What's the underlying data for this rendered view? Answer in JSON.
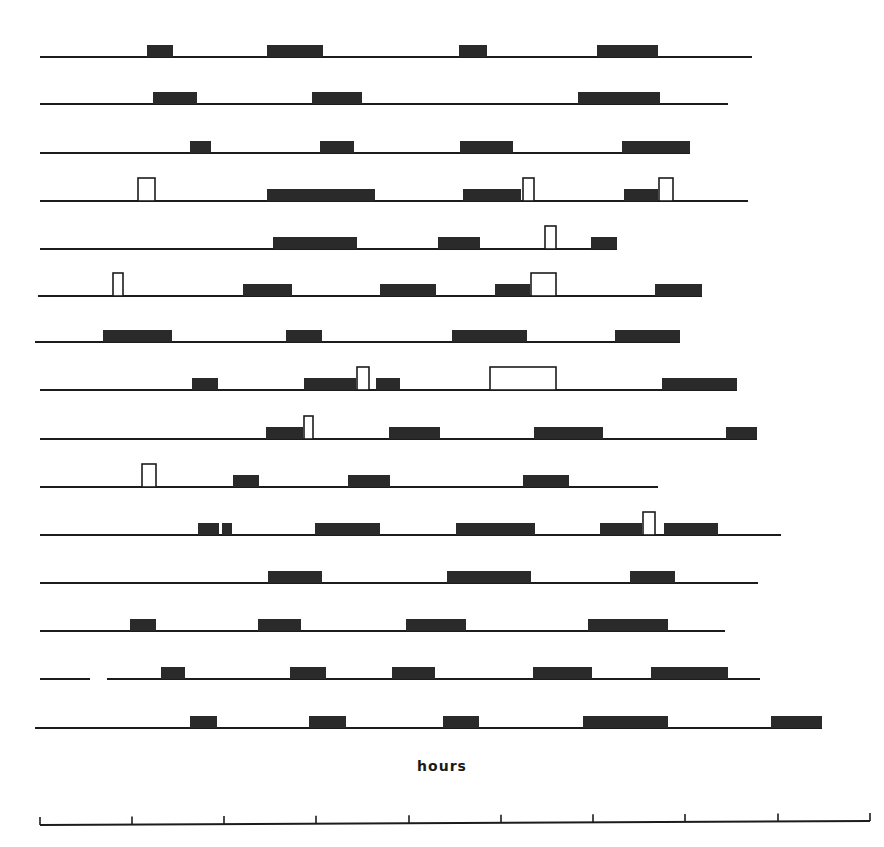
{
  "chart_data": {
    "type": "gantt-raster",
    "title": "",
    "xlabel": "hours",
    "ylabel": "",
    "axis": {
      "y": 825,
      "x_start": 40,
      "x_end": 870,
      "ticks_px": [
        40,
        132,
        224,
        316,
        409,
        501,
        593,
        685,
        778,
        870
      ],
      "tick_labels": []
    },
    "colors": {
      "ink": "#1c1c1c",
      "filled": "#2a2a2a",
      "open_fill": "#ffffff"
    },
    "bar_height": 12,
    "open_height": 23,
    "rows": [
      {
        "y": 57,
        "line": [
          [
            40,
            752
          ]
        ],
        "blocks": [
          {
            "x0": 147,
            "x1": 173,
            "type": "filled"
          },
          {
            "x0": 267,
            "x1": 323,
            "type": "filled"
          },
          {
            "x0": 459,
            "x1": 487,
            "type": "filled"
          },
          {
            "x0": 597,
            "x1": 658,
            "type": "filled"
          }
        ]
      },
      {
        "y": 104,
        "line": [
          [
            40,
            728
          ]
        ],
        "blocks": [
          {
            "x0": 153,
            "x1": 197,
            "type": "filled"
          },
          {
            "x0": 312,
            "x1": 362,
            "type": "filled"
          },
          {
            "x0": 578,
            "x1": 660,
            "type": "filled"
          }
        ]
      },
      {
        "y": 153,
        "line": [
          [
            40,
            690
          ]
        ],
        "blocks": [
          {
            "x0": 190,
            "x1": 211,
            "type": "filled"
          },
          {
            "x0": 320,
            "x1": 354,
            "type": "filled"
          },
          {
            "x0": 460,
            "x1": 513,
            "type": "filled"
          },
          {
            "x0": 622,
            "x1": 690,
            "type": "filled"
          }
        ]
      },
      {
        "y": 201,
        "line": [
          [
            40,
            748
          ]
        ],
        "blocks": [
          {
            "x0": 137,
            "x1": 156,
            "type": "open"
          },
          {
            "x0": 267,
            "x1": 375,
            "type": "filled"
          },
          {
            "x0": 463,
            "x1": 521,
            "type": "filled"
          },
          {
            "x0": 522,
            "x1": 535,
            "type": "open"
          },
          {
            "x0": 624,
            "x1": 658,
            "type": "filled"
          },
          {
            "x0": 658,
            "x1": 674,
            "type": "open"
          }
        ]
      },
      {
        "y": 249,
        "line": [
          [
            40,
            617
          ]
        ],
        "blocks": [
          {
            "x0": 273,
            "x1": 357,
            "type": "filled"
          },
          {
            "x0": 438,
            "x1": 480,
            "type": "filled"
          },
          {
            "x0": 544,
            "x1": 557,
            "type": "open"
          },
          {
            "x0": 591,
            "x1": 617,
            "type": "filled"
          }
        ]
      },
      {
        "y": 296,
        "line": [
          [
            38,
            702
          ]
        ],
        "blocks": [
          {
            "x0": 112,
            "x1": 124,
            "type": "open"
          },
          {
            "x0": 243,
            "x1": 292,
            "type": "filled"
          },
          {
            "x0": 380,
            "x1": 436,
            "type": "filled"
          },
          {
            "x0": 495,
            "x1": 530,
            "type": "filled"
          },
          {
            "x0": 530,
            "x1": 557,
            "type": "open"
          },
          {
            "x0": 655,
            "x1": 702,
            "type": "filled"
          }
        ]
      },
      {
        "y": 342,
        "line": [
          [
            35,
            680
          ]
        ],
        "blocks": [
          {
            "x0": 103,
            "x1": 172,
            "type": "filled"
          },
          {
            "x0": 286,
            "x1": 322,
            "type": "filled"
          },
          {
            "x0": 452,
            "x1": 527,
            "type": "filled"
          },
          {
            "x0": 615,
            "x1": 680,
            "type": "filled"
          }
        ]
      },
      {
        "y": 390,
        "line": [
          [
            40,
            737
          ]
        ],
        "blocks": [
          {
            "x0": 192,
            "x1": 218,
            "type": "filled"
          },
          {
            "x0": 304,
            "x1": 356,
            "type": "filled"
          },
          {
            "x0": 356,
            "x1": 370,
            "type": "open"
          },
          {
            "x0": 376,
            "x1": 400,
            "type": "filled"
          },
          {
            "x0": 489,
            "x1": 557,
            "type": "open"
          },
          {
            "x0": 662,
            "x1": 737,
            "type": "filled"
          }
        ]
      },
      {
        "y": 439,
        "line": [
          [
            40,
            757
          ]
        ],
        "blocks": [
          {
            "x0": 266,
            "x1": 303,
            "type": "filled"
          },
          {
            "x0": 303,
            "x1": 314,
            "type": "open"
          },
          {
            "x0": 389,
            "x1": 440,
            "type": "filled"
          },
          {
            "x0": 534,
            "x1": 603,
            "type": "filled"
          },
          {
            "x0": 726,
            "x1": 757,
            "type": "filled"
          }
        ]
      },
      {
        "y": 487,
        "line": [
          [
            40,
            658
          ]
        ],
        "blocks": [
          {
            "x0": 141,
            "x1": 157,
            "type": "open"
          },
          {
            "x0": 233,
            "x1": 259,
            "type": "filled"
          },
          {
            "x0": 348,
            "x1": 390,
            "type": "filled"
          },
          {
            "x0": 523,
            "x1": 569,
            "type": "filled"
          }
        ]
      },
      {
        "y": 535,
        "line": [
          [
            40,
            781
          ]
        ],
        "blocks": [
          {
            "x0": 198,
            "x1": 219,
            "type": "filled"
          },
          {
            "x0": 222,
            "x1": 232,
            "type": "filled"
          },
          {
            "x0": 315,
            "x1": 380,
            "type": "filled"
          },
          {
            "x0": 456,
            "x1": 535,
            "type": "filled"
          },
          {
            "x0": 600,
            "x1": 642,
            "type": "filled"
          },
          {
            "x0": 642,
            "x1": 656,
            "type": "open"
          },
          {
            "x0": 664,
            "x1": 718,
            "type": "filled"
          }
        ]
      },
      {
        "y": 583,
        "line": [
          [
            40,
            758
          ]
        ],
        "blocks": [
          {
            "x0": 268,
            "x1": 322,
            "type": "filled"
          },
          {
            "x0": 447,
            "x1": 531,
            "type": "filled"
          },
          {
            "x0": 630,
            "x1": 675,
            "type": "filled"
          }
        ]
      },
      {
        "y": 631,
        "line": [
          [
            40,
            725
          ]
        ],
        "blocks": [
          {
            "x0": 130,
            "x1": 156,
            "type": "filled"
          },
          {
            "x0": 258,
            "x1": 301,
            "type": "filled"
          },
          {
            "x0": 406,
            "x1": 466,
            "type": "filled"
          },
          {
            "x0": 588,
            "x1": 668,
            "type": "filled"
          }
        ]
      },
      {
        "y": 679,
        "line": [
          [
            40,
            90
          ],
          [
            107,
            760
          ]
        ],
        "blocks": [
          {
            "x0": 161,
            "x1": 185,
            "type": "filled"
          },
          {
            "x0": 290,
            "x1": 326,
            "type": "filled"
          },
          {
            "x0": 392,
            "x1": 435,
            "type": "filled"
          },
          {
            "x0": 533,
            "x1": 592,
            "type": "filled"
          },
          {
            "x0": 651,
            "x1": 728,
            "type": "filled"
          }
        ]
      },
      {
        "y": 728,
        "line": [
          [
            35,
            822
          ]
        ],
        "blocks": [
          {
            "x0": 190,
            "x1": 217,
            "type": "filled"
          },
          {
            "x0": 309,
            "x1": 346,
            "type": "filled"
          },
          {
            "x0": 443,
            "x1": 479,
            "type": "filled"
          },
          {
            "x0": 583,
            "x1": 668,
            "type": "filled"
          },
          {
            "x0": 771,
            "x1": 822,
            "type": "filled"
          }
        ]
      }
    ],
    "legend": []
  }
}
